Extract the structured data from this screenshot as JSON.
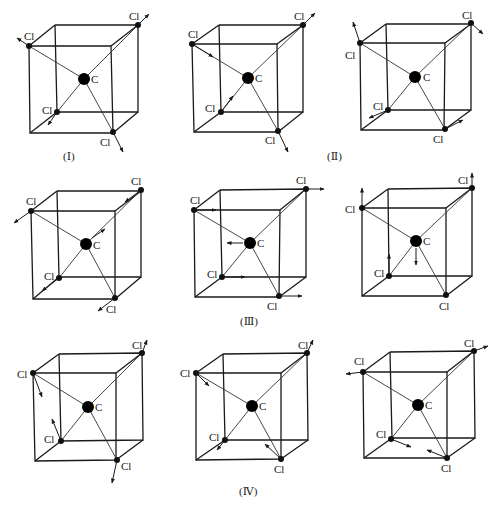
{
  "figure": {
    "colors": {
      "ink": "#1a1a1a",
      "background": "#ffffff"
    },
    "atom_labels": {
      "center": "C",
      "ligand": "Cl"
    },
    "groups": [
      {
        "id": "I",
        "label": "(Ⅰ)"
      },
      {
        "id": "II",
        "label": "(Ⅱ)"
      },
      {
        "id": "III",
        "label": "(Ⅲ)"
      },
      {
        "id": "IV",
        "label": "(Ⅳ)"
      }
    ],
    "panels": [
      {
        "row": 1,
        "col": 1,
        "group": "I",
        "arrows": "all Cl outward along bonds"
      },
      {
        "row": 1,
        "col": 2,
        "group": "II",
        "arrows": "two Cl inward, two Cl outward along bonds"
      },
      {
        "row": 1,
        "col": 3,
        "group": "II",
        "arrows": "Cl perpendicular to bonds (bending)"
      },
      {
        "row": 2,
        "col": 1,
        "group": "III",
        "arrows": "Cl and C displaced along body diagonal direction"
      },
      {
        "row": 2,
        "col": 2,
        "group": "III",
        "arrows": "all Cl displaced right, C displaced left"
      },
      {
        "row": 2,
        "col": 3,
        "group": "III",
        "arrows": "two Cl displaced up, C displaced down"
      },
      {
        "row": 3,
        "col": 1,
        "group": "IV",
        "arrows": "Cl bending displacements"
      },
      {
        "row": 3,
        "col": 2,
        "group": "IV",
        "arrows": "Cl bending displacements"
      },
      {
        "row": 3,
        "col": 3,
        "group": "IV",
        "arrows": "Cl bending displacements"
      }
    ]
  }
}
